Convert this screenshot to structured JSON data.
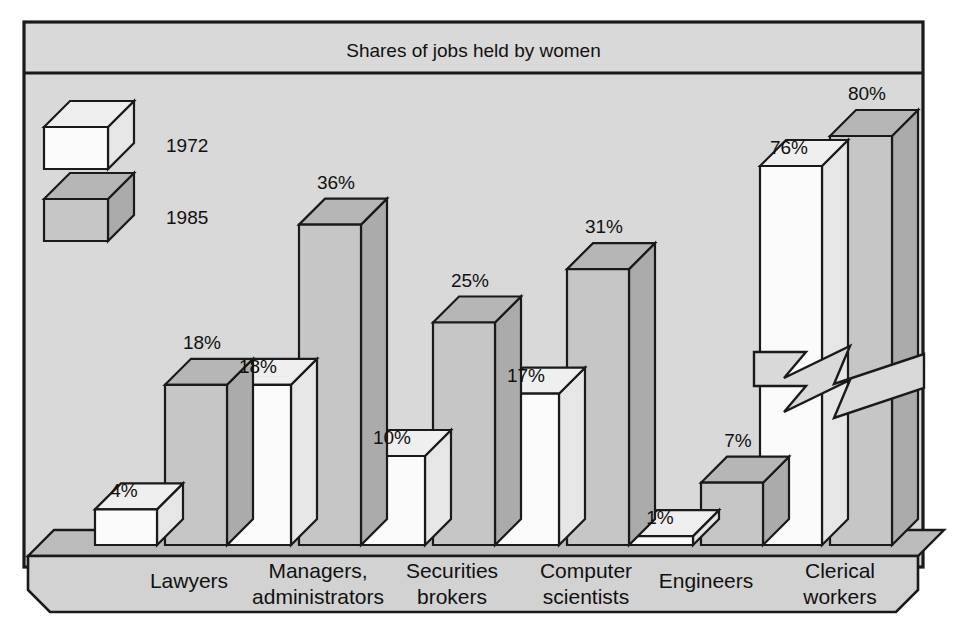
{
  "figure": {
    "title": "Shares of jobs held by women",
    "frame_color": "#1a1a1a",
    "panel_color": "#d9d9d9",
    "base_top_color": "#bcbcbc",
    "base_front_color": "#d2d2d2"
  },
  "legend": {
    "position": "top-left",
    "entries": [
      {
        "label": "1972",
        "swatch": "white-cube",
        "face_color": "#fbfbfb",
        "top_color": "#efefef",
        "side_color": "#e2e2e2"
      },
      {
        "label": "1985",
        "swatch": "gray-cube",
        "face_color": "#c6c6c6",
        "top_color": "#b4b4b4",
        "side_color": "#a8a8a8"
      }
    ]
  },
  "annotations": {
    "axis_break": {
      "name": "zigzag-break-marker",
      "applies_to": "Clerical workers",
      "note": "bars truncated"
    }
  },
  "chart_data": {
    "type": "bar",
    "title": "Shares of jobs held by women",
    "xlabel": "",
    "ylabel": "",
    "ylim": [
      0,
      40
    ],
    "grid": false,
    "legend_position": "top-left",
    "unit": "%",
    "broken_axis": true,
    "categories": [
      "Lawyers",
      "Managers,\nadministrators",
      "Securities\nbrokers",
      "Computer\nscientists",
      "Engineers",
      "Clerical\nworkers"
    ],
    "category_lines": [
      [
        "Lawyers"
      ],
      [
        "Managers,",
        "administrators"
      ],
      [
        "Securities",
        "brokers"
      ],
      [
        "Computer",
        "scientists"
      ],
      [
        "Engineers"
      ],
      [
        "Clerical",
        "workers"
      ]
    ],
    "series": [
      {
        "name": "1972",
        "values": [
          4,
          18,
          10,
          17,
          1,
          76
        ],
        "labels": [
          "4%",
          "18%",
          "10%",
          "17%",
          "1%",
          "76%"
        ]
      },
      {
        "name": "1985",
        "values": [
          18,
          36,
          25,
          31,
          7,
          80
        ],
        "labels": [
          "18%",
          "36%",
          "25%",
          "31%",
          "7%",
          "80%"
        ]
      }
    ]
  }
}
